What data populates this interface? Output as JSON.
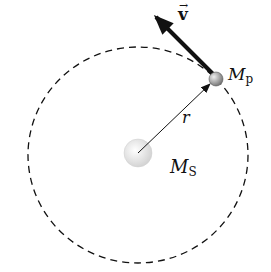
{
  "diagram": {
    "title": "",
    "labels": {
      "velocity": "v",
      "velocity_arrow_glyph": "→",
      "planet_mass": "M",
      "planet_subscript": "p",
      "sun_mass": "M",
      "sun_subscript": "S",
      "radius": "r"
    },
    "elements": {
      "orbit": {
        "style": "dashed",
        "cx": 138,
        "cy": 155,
        "rx": 110,
        "ry": 108
      },
      "sun": {
        "cx": 138,
        "cy": 153,
        "r": 14
      },
      "planet": {
        "cx": 216,
        "cy": 79,
        "r": 7
      },
      "velocity_vector": {
        "from": [
          213,
          74
        ],
        "to": [
          156,
          17
        ]
      },
      "radius_vector": {
        "from": [
          138,
          153
        ],
        "to": [
          210,
          84
        ]
      }
    },
    "colors": {
      "line": "#111111",
      "sun": "#e6e6e6",
      "planet": "#9a9a9a"
    }
  }
}
